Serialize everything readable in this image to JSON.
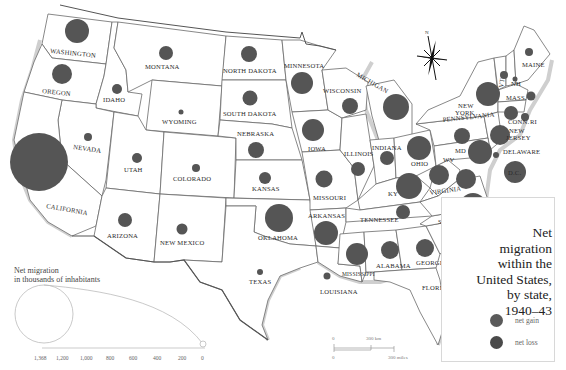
{
  "title": {
    "lines": [
      "Net",
      "migration",
      "within the",
      "United States,",
      "by state,",
      "1940–43"
    ]
  },
  "legend": {
    "items": [
      {
        "label": "net gain",
        "color": "#5a5a5a"
      },
      {
        "label": "net loss",
        "color": "#4a4a4a"
      }
    ]
  },
  "size_scale": {
    "title_lines": [
      "Net migration",
      "in thousands of inhabitants"
    ],
    "ticks": [
      "1,368",
      "1,200",
      "1,000",
      "800",
      "600",
      "400",
      "200",
      "0"
    ]
  },
  "distance_scale": {
    "km_labels": [
      "0",
      "300 km"
    ],
    "mile_labels": [
      "0",
      "300 miles"
    ]
  },
  "compass": {
    "label": "N"
  },
  "states": [
    {
      "name": "WASHINGTON",
      "value_est": 210
    },
    {
      "name": "OREGON",
      "value_est": 150
    },
    {
      "name": "CALIFORNIA",
      "value_est": 1368
    },
    {
      "name": "IDAHO",
      "value_est": 40
    },
    {
      "name": "NEVADA",
      "value_est": 20
    },
    {
      "name": "MONTANA",
      "value_est": 50
    },
    {
      "name": "WYOMING",
      "value_est": 5
    },
    {
      "name": "UTAH",
      "value_est": 30
    },
    {
      "name": "COLORADO",
      "value_est": 15
    },
    {
      "name": "ARIZONA",
      "value_est": 60
    },
    {
      "name": "NEW MEXICO",
      "value_est": 40
    },
    {
      "name": "NORTH DAKOTA",
      "value_est": 100
    },
    {
      "name": "SOUTH DAKOTA",
      "value_est": 80
    },
    {
      "name": "NEBRASKA",
      "value_est": 100
    },
    {
      "name": "KANSAS",
      "value_est": 60
    },
    {
      "name": "OKLAHOMA",
      "value_est": 360
    },
    {
      "name": "TEXAS",
      "value_est": 25
    },
    {
      "name": "MINNESOTA",
      "value_est": 200
    },
    {
      "name": "IOWA",
      "value_est": 200
    },
    {
      "name": "MISSOURI",
      "value_est": 120
    },
    {
      "name": "ARKANSAS",
      "value_est": 260
    },
    {
      "name": "LOUISIANA",
      "value_est": 20
    },
    {
      "name": "WISCONSIN",
      "value_est": 110
    },
    {
      "name": "ILLINOIS",
      "value_est": 70
    },
    {
      "name": "MICHIGAN",
      "value_est": 300
    },
    {
      "name": "INDIANA",
      "value_est": 90
    },
    {
      "name": "OHIO",
      "value_est": 230
    },
    {
      "name": "KY",
      "value_est": 270
    },
    {
      "name": "TENNESSEE",
      "value_est": 80
    },
    {
      "name": "MISSISSIPPI",
      "value_est": 200
    },
    {
      "name": "ALABAMA",
      "value_est": 130
    },
    {
      "name": "GEORGIA",
      "value_est": 130
    },
    {
      "name": "FLORIDA",
      "value_est": 200
    },
    {
      "name": "SC",
      "value_est": 150
    },
    {
      "name": "NC",
      "value_est": 260
    },
    {
      "name": "VIRGINIA",
      "value_est": 150
    },
    {
      "name": "WV",
      "value_est": 150
    },
    {
      "name": "MD",
      "value_est": 260
    },
    {
      "name": "DELAWARE",
      "value_est": 10
    },
    {
      "name": "D.C.",
      "value_est": 180
    },
    {
      "name": "PENNSYLVANIA",
      "value_est": 120
    },
    {
      "name": "NEW JERSEY",
      "value_est": 190
    },
    {
      "name": "NEW YORK",
      "value_est": 290
    },
    {
      "name": "CONN.",
      "value_est": 130
    },
    {
      "name": "RI",
      "value_est": 30
    },
    {
      "name": "MASS.",
      "value_est": 50
    },
    {
      "name": "VT",
      "value_est": 30
    },
    {
      "name": "NH",
      "value_est": 10
    },
    {
      "name": "MAINE",
      "value_est": 30
    }
  ],
  "labels": {
    "WA": "WASHINGTON",
    "OR": "OREGON",
    "CA": "CALIFORNIA",
    "ID": "IDAHO",
    "NV": "NEVADA",
    "MT": "MONTANA",
    "WY": "WYOMING",
    "UT": "UTAH",
    "CO": "COLORADO",
    "AZ": "ARIZONA",
    "NM": "NEW MEXICO",
    "ND": "NORTH DAKOTA",
    "SD": "SOUTH DAKOTA",
    "NE": "NEBRASKA",
    "KS": "KANSAS",
    "OK": "OKLAHOMA",
    "TX": "TEXAS",
    "MN": "MINNESOTA",
    "IA": "IOWA",
    "MO": "MISSOURI",
    "AR": "ARKANSAS",
    "LA": "LOUISIANA",
    "WI": "WISCONSIN",
    "IL": "ILLINOIS",
    "MI": "MICHIGAN",
    "IN": "INDIANA",
    "OH": "OHIO",
    "KY": "KY",
    "TN": "TENNESSEE",
    "MS": "MISSISSIPPI",
    "AL": "ALABAMA",
    "GA": "GEORGIA",
    "FL": "FLORIDA",
    "SC": "SC",
    "NC": "NC",
    "VA": "VIRGINIA",
    "WV": "WV",
    "MD": "MD",
    "DE": "DELAWARE",
    "DC": "D.C.",
    "PA": "PENNSYLVANIA",
    "NJ1": "NEW",
    "NJ2": "JERSEY",
    "NY1": "NEW",
    "NY2": "YORK",
    "CT": "CONN.",
    "RI": "RI",
    "MA": "MASS.",
    "VT": "VT",
    "NH": "NH",
    "ME": "MAINE"
  }
}
